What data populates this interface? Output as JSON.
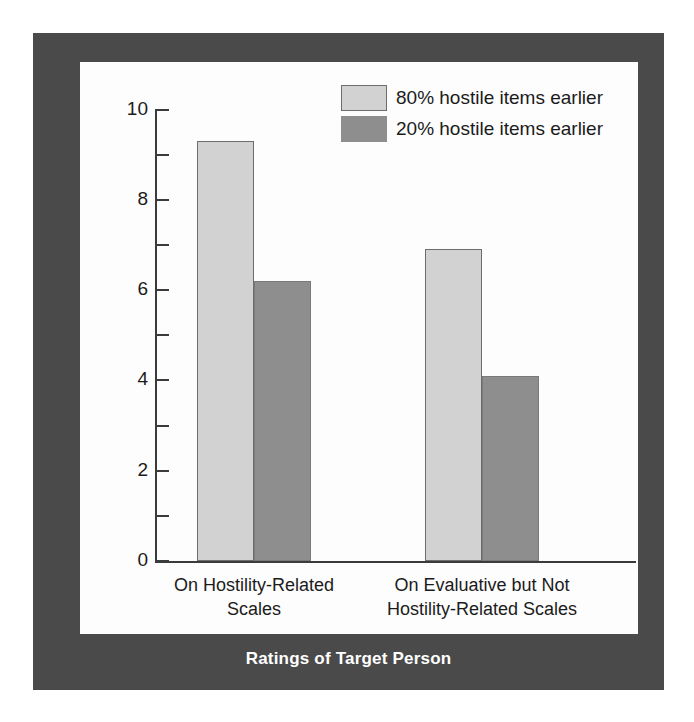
{
  "chart_data": {
    "type": "bar",
    "title": "",
    "xlabel": "Ratings of Target Person",
    "ylabel": "Negativity",
    "categories": [
      "On Hostility-Related Scales",
      "On Evaluative but Not Hostility-Related Scales"
    ],
    "category_lines": [
      [
        "On Hostility-Related",
        "Scales"
      ],
      [
        "On Evaluative but Not",
        "Hostility-Related Scales"
      ]
    ],
    "series": [
      {
        "name": "80% hostile items earlier",
        "values": [
          9.3,
          6.9
        ],
        "color": "#d2d2d2"
      },
      {
        "name": "20% hostile items earlier",
        "values": [
          6.2,
          4.1
        ],
        "color": "#8e8e8e"
      }
    ],
    "ylim": [
      0,
      10
    ],
    "ytick_labels": [
      "0",
      "2",
      "4",
      "6",
      "8",
      "10"
    ],
    "ytick_values": [
      0,
      2,
      4,
      6,
      8,
      10
    ],
    "yminor_values": [
      1,
      3,
      5,
      7,
      9
    ],
    "grid": false,
    "legend_position": "top-right"
  },
  "legend": {
    "items": [
      {
        "label": "80% hostile items earlier",
        "swatch": "light"
      },
      {
        "label": "20% hostile items earlier",
        "swatch": "dark"
      }
    ]
  },
  "axes": {
    "y_title": "Negativity",
    "x_title": "Ratings of Target Person",
    "y_labels": {
      "t0": "0",
      "t2": "2",
      "t4": "4",
      "t6": "6",
      "t8": "8",
      "t10": "10"
    }
  },
  "categories": {
    "c1_line1": "On Hostility-Related",
    "c1_line2": "Scales",
    "c2_line1": "On Evaluative but Not",
    "c2_line2": "Hostility-Related Scales"
  },
  "colors": {
    "frame": "#4a4a4a",
    "panel": "#fdfdfd",
    "bar_light": "#d2d2d2",
    "bar_dark": "#8e8e8e",
    "axis": "#3b3b3b",
    "text": "#1b1b1b",
    "frame_text": "#ffffff"
  }
}
